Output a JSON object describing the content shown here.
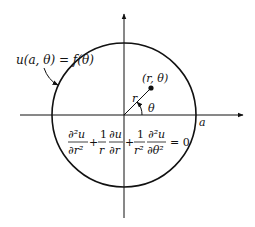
{
  "diagram": {
    "type": "polar-disk-boundary-value-problem",
    "boundary_label": "u(a, θ) = f(θ)",
    "point_label": "(r, θ)",
    "radius_label": "r",
    "angle_label": "θ",
    "axis_label_a": "a",
    "equation": {
      "term1_num": "∂²u",
      "term1_den": "∂r²",
      "plus1": "+",
      "term2_coef_num": "1",
      "term2_coef_den": "r",
      "term2_num": "∂u",
      "term2_den": "∂r",
      "plus2": "+",
      "term3_coef_num": "1",
      "term3_coef_den": "r²",
      "term3_num": "∂²u",
      "term3_den": "∂θ²",
      "equals": "= 0"
    },
    "colors": {
      "stroke": "#111111",
      "background": "#ffffff"
    }
  }
}
